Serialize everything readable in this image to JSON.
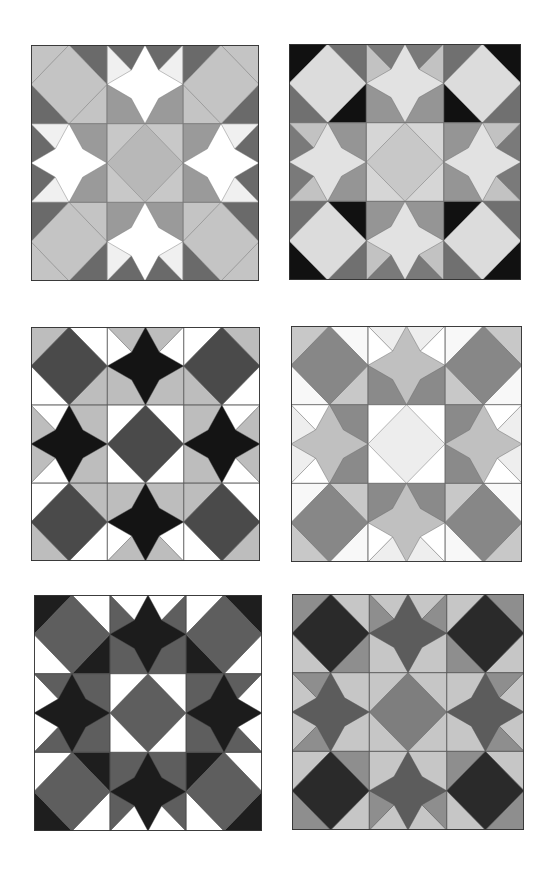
{
  "page": {
    "background": "#ffffff"
  },
  "blocks": [
    {
      "id": "block-1",
      "pos": [
        31,
        45,
        228,
        236
      ],
      "colors": {
        "corner_diamond": "#c4c4c4",
        "corner_tri_a": "#c4c4c4",
        "corner_tri_b": "#6a6a6a",
        "star": "#ffffff",
        "edge_outer": "#6a6a6a",
        "edge_side": "#f0f0f0",
        "edge_inner": "#9a9a9a",
        "center_diamond": "#b8b8b8",
        "center_tri": "#c8c8c8",
        "line": "#7a7a7a"
      }
    },
    {
      "id": "block-2",
      "pos": [
        289,
        44,
        232,
        236
      ],
      "colors": {
        "corner_diamond": "#dcdcdc",
        "corner_tri_a": "#111111",
        "corner_tri_b": "#707070",
        "star": "#e2e2e2",
        "edge_outer": "#7a7a7a",
        "edge_side": "#c2c2c2",
        "edge_inner": "#959595",
        "center_diamond": "#c8c8c8",
        "center_tri": "#d6d6d6",
        "line": "#6a6a6a"
      }
    },
    {
      "id": "block-3",
      "pos": [
        31,
        327,
        229,
        234
      ],
      "colors": {
        "corner_diamond": "#4a4a4a",
        "corner_tri_a": "#bdbdbd",
        "corner_tri_b": "#ffffff",
        "star": "#141414",
        "edge_outer": "#bdbdbd",
        "edge_side": "#ffffff",
        "edge_inner": "#bdbdbd",
        "center_diamond": "#4a4a4a",
        "center_tri": "#ffffff",
        "line": "#5a5a5a"
      }
    },
    {
      "id": "block-4",
      "pos": [
        291,
        326,
        231,
        236
      ],
      "colors": {
        "corner_diamond": "#878787",
        "corner_tri_a": "#c8c8c8",
        "corner_tri_b": "#f8f8f8",
        "star": "#c0c0c0",
        "edge_outer": "#eeeeee",
        "edge_side": "#ffffff",
        "edge_inner": "#8a8a8a",
        "center_diamond": "#ededed",
        "center_tri": "#ffffff",
        "line": "#6a6a6a"
      }
    },
    {
      "id": "block-5",
      "pos": [
        34,
        595,
        228,
        236
      ],
      "colors": {
        "corner_diamond": "#5e5e5e",
        "corner_tri_a": "#1e1e1e",
        "corner_tri_b": "#ffffff",
        "star": "#1c1c1c",
        "edge_outer": "#ffffff",
        "edge_side": "#5e5e5e",
        "edge_inner": "#5e5e5e",
        "center_diamond": "#5e5e5e",
        "center_tri": "#ffffff",
        "line": "#4a4a4a"
      }
    },
    {
      "id": "block-6",
      "pos": [
        292,
        594,
        232,
        236
      ],
      "colors": {
        "corner_diamond": "#2a2a2a",
        "corner_tri_a": "#8e8e8e",
        "corner_tri_b": "#c6c6c6",
        "star": "#5c5c5c",
        "edge_outer": "#c6c6c6",
        "edge_side": "#8e8e8e",
        "edge_inner": "#c6c6c6",
        "center_diamond": "#7e7e7e",
        "center_tri": "#c6c6c6",
        "line": "#555555"
      }
    }
  ]
}
